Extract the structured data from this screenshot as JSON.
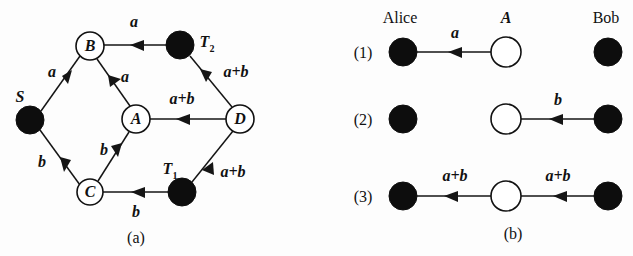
{
  "figure": {
    "width": 633,
    "height": 256,
    "background_color": "#fdfdfd",
    "ink_color": "#111111",
    "filled_node_color": "#0d0d0d",
    "open_node_color": "#ffffff"
  },
  "panel_a": {
    "caption": "(a)",
    "nodes": [
      {
        "id": "S",
        "label": "S",
        "style": "filled",
        "cx": 30,
        "cy": 120,
        "r": 14,
        "label_x": 20,
        "label_y": 97
      },
      {
        "id": "B",
        "label": "B",
        "style": "open",
        "cx": 90,
        "cy": 46,
        "r": 14,
        "label_x": 90,
        "label_y": 46
      },
      {
        "id": "A",
        "label": "A",
        "style": "open",
        "cx": 136,
        "cy": 119,
        "r": 14,
        "label_x": 136,
        "label_y": 119
      },
      {
        "id": "C",
        "label": "C",
        "style": "open",
        "cx": 90,
        "cy": 192,
        "r": 13,
        "label_x": 90,
        "label_y": 192
      },
      {
        "id": "D",
        "label": "D",
        "style": "open",
        "cx": 240,
        "cy": 119,
        "r": 14,
        "label_x": 240,
        "label_y": 119
      },
      {
        "id": "T2",
        "label": "T",
        "sub": "2",
        "style": "filled",
        "cx": 180,
        "cy": 45,
        "r": 14,
        "label_x": 207,
        "label_y": 44
      },
      {
        "id": "T1",
        "label": "T",
        "sub": "1",
        "style": "filled",
        "cx": 182,
        "cy": 192,
        "r": 14,
        "label_x": 170,
        "label_y": 171
      }
    ],
    "edges": [
      {
        "from": "S",
        "to": "B",
        "label": "a",
        "label_x": 52,
        "label_y": 72
      },
      {
        "from": "S",
        "to": "C",
        "label": "b",
        "label_x": 42,
        "label_y": 162
      },
      {
        "from": "B",
        "to": "T2",
        "label": "a",
        "label_x": 134,
        "label_y": 22
      },
      {
        "from": "B",
        "to": "A",
        "label": "a",
        "label_x": 125,
        "label_y": 77
      },
      {
        "from": "C",
        "to": "A",
        "label": "b",
        "label_x": 104,
        "label_y": 150
      },
      {
        "from": "C",
        "to": "T1",
        "label": "b",
        "label_x": 136,
        "label_y": 212
      },
      {
        "from": "A",
        "to": "D",
        "label": "a+b",
        "label_x": 182,
        "label_y": 99
      },
      {
        "from": "D",
        "to": "T2",
        "label": "a+b",
        "label_x": 236,
        "label_y": 72
      },
      {
        "from": "D",
        "to": "T1",
        "label": "a+b",
        "label_x": 233,
        "label_y": 172
      }
    ],
    "caption_x": 136,
    "caption_y": 238
  },
  "panel_b": {
    "caption": "(b)",
    "caption_x": 513,
    "caption_y": 234,
    "column_headers": [
      {
        "text": "Alice",
        "x": 400,
        "y": 18
      },
      {
        "text": "A",
        "x": 506,
        "y": 18,
        "italic": true
      },
      {
        "text": "Bob",
        "x": 606,
        "y": 18
      }
    ],
    "columns": {
      "alice_cx": 403,
      "relay_cx": 506,
      "bob_cx": 608,
      "r": 14,
      "relay_r": 15
    },
    "rows": [
      {
        "step": "(1)",
        "step_x": 363,
        "y": 52,
        "nodes": [
          {
            "role": "alice",
            "style": "filled"
          },
          {
            "role": "relay",
            "style": "open"
          },
          {
            "role": "bob",
            "style": "filled"
          }
        ],
        "arrows": [
          {
            "from": "alice",
            "to": "relay",
            "direction": "right",
            "label": "a",
            "label_x": 455,
            "label_y": 33
          }
        ]
      },
      {
        "step": "(2)",
        "step_x": 363,
        "y": 119,
        "nodes": [
          {
            "role": "alice",
            "style": "filled"
          },
          {
            "role": "relay",
            "style": "open"
          },
          {
            "role": "bob",
            "style": "filled"
          }
        ],
        "arrows": [
          {
            "from": "bob",
            "to": "relay",
            "direction": "left",
            "label": "b",
            "label_x": 558,
            "label_y": 100
          }
        ]
      },
      {
        "step": "(3)",
        "step_x": 363,
        "y": 196,
        "nodes": [
          {
            "role": "alice",
            "style": "filled"
          },
          {
            "role": "relay",
            "style": "open"
          },
          {
            "role": "bob",
            "style": "filled"
          }
        ],
        "arrows": [
          {
            "from": "relay",
            "to": "alice",
            "direction": "left",
            "label": "a+b",
            "label_x": 455,
            "label_y": 176
          },
          {
            "from": "relay",
            "to": "bob",
            "direction": "right",
            "label": "a+b",
            "label_x": 558,
            "label_y": 176
          }
        ]
      }
    ]
  }
}
